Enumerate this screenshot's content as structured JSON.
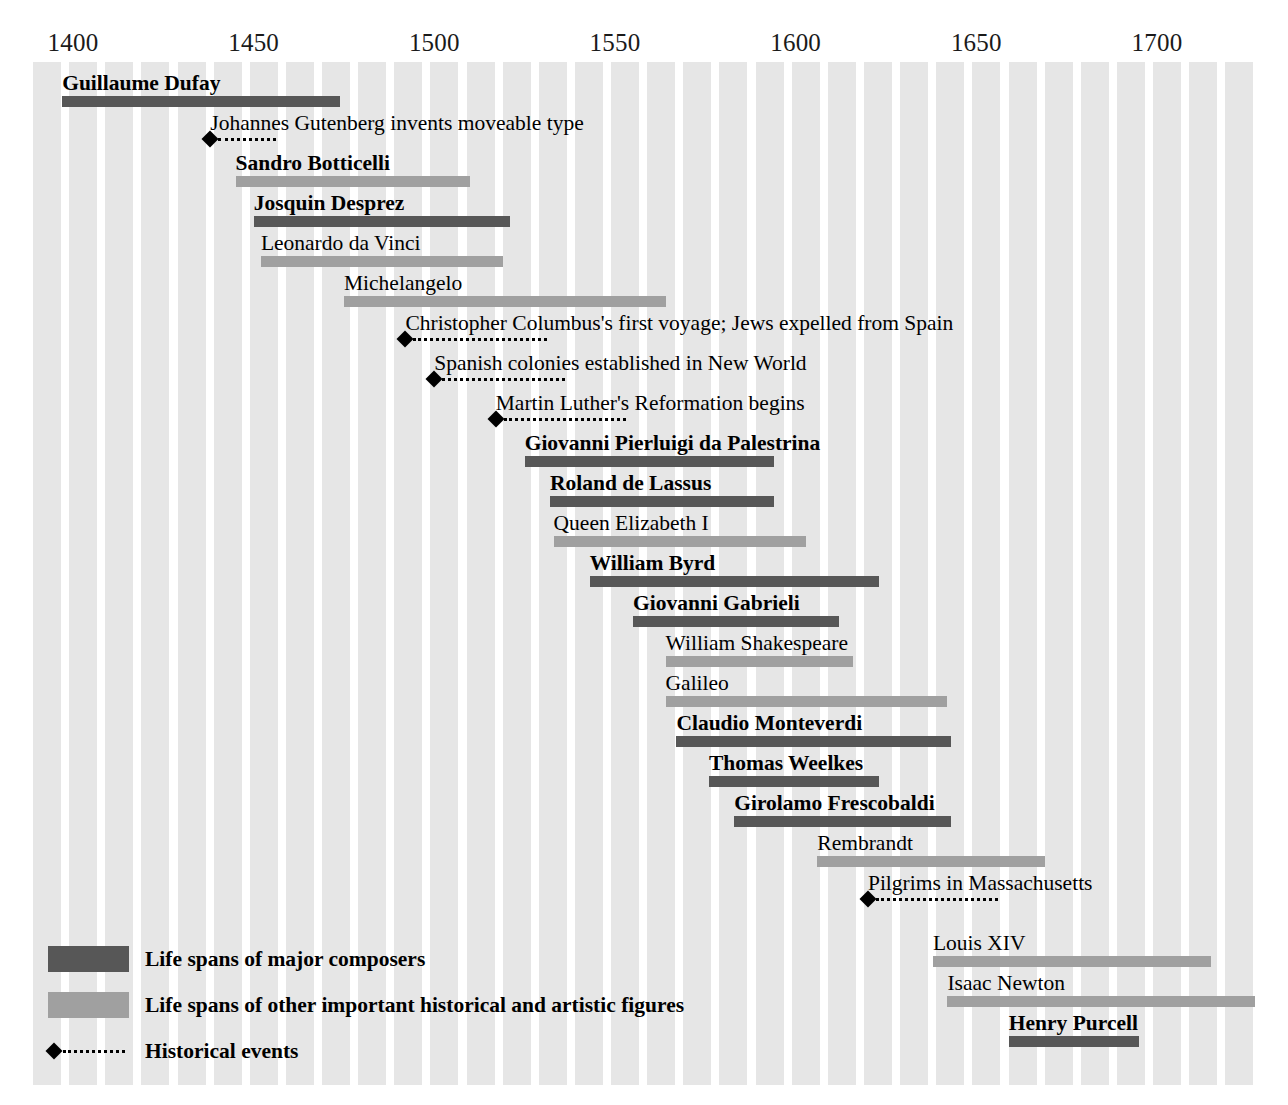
{
  "chart_data": {
    "type": "bar",
    "title": "",
    "subtitle": "",
    "xlabel": "",
    "ylabel": "",
    "xlim": [
      1390,
      1718
    ],
    "axis_ticks": [
      1400,
      1450,
      1500,
      1550,
      1600,
      1650,
      1700
    ],
    "tick_labels": [
      "1400",
      "1450",
      "1500",
      "1550",
      "1600",
      "1650",
      "1700"
    ],
    "grid": "vertical-striped-bands",
    "legend_position": "bottom-left",
    "orientation": "horizontal-timeline",
    "categories": [
      "Guillaume Dufay",
      "Johannes Gutenberg invents moveable type",
      "Sandro Botticelli",
      "Josquin Desprez",
      "Leonardo da Vinci",
      "Michelangelo",
      "Christopher Columbus's first voyage; Jews expelled from Spain",
      "Spanish colonies established in New World",
      "Martin Luther's Reformation begins",
      "Giovanni Pierluigi da Palestrina",
      "Roland de Lassus",
      "Queen Elizabeth I",
      "William Byrd",
      "Giovanni Gabrieli",
      "William Shakespeare",
      "Galileo",
      "Claudio Monteverdi",
      "Thomas Weelkes",
      "Girolamo Frescobaldi",
      "Rembrandt",
      "Pilgrims in Massachusetts",
      "Louis XIV",
      "Isaac Newton",
      "Henry Purcell"
    ],
    "series": [
      {
        "name": "Life spans of major composers",
        "color": "#575757",
        "items": [
          {
            "label": "Guillaume Dufay",
            "start": 1397,
            "end": 1474
          },
          {
            "label": "Josquin Desprez",
            "start": 1450,
            "end": 1521
          },
          {
            "label": "Giovanni Pierluigi da Palestrina",
            "start": 1525,
            "end": 1594
          },
          {
            "label": "Roland de Lassus",
            "start": 1532,
            "end": 1594
          },
          {
            "label": "William Byrd",
            "start": 1543,
            "end": 1623
          },
          {
            "label": "Giovanni Gabrieli",
            "start": 1555,
            "end": 1612
          },
          {
            "label": "Claudio Monteverdi",
            "start": 1567,
            "end": 1643
          },
          {
            "label": "Thomas Weelkes",
            "start": 1576,
            "end": 1623
          },
          {
            "label": "Girolamo Frescobaldi",
            "start": 1583,
            "end": 1643
          },
          {
            "label": "Henry Purcell",
            "start": 1659,
            "end": 1695
          }
        ]
      },
      {
        "name": "Life spans of other important historical and artistic figures",
        "color": "#a0a0a0",
        "items": [
          {
            "label": "Sandro Botticelli",
            "start": 1445,
            "end": 1510
          },
          {
            "label": "Leonardo da Vinci",
            "start": 1452,
            "end": 1519
          },
          {
            "label": "Michelangelo",
            "start": 1475,
            "end": 1564
          },
          {
            "label": "Queen Elizabeth I",
            "start": 1533,
            "end": 1603
          },
          {
            "label": "William Shakespeare",
            "start": 1564,
            "end": 1616
          },
          {
            "label": "Galileo",
            "start": 1564,
            "end": 1642
          },
          {
            "label": "Rembrandt",
            "start": 1606,
            "end": 1669
          },
          {
            "label": "Louis XIV",
            "start": 1638,
            "end": 1715
          },
          {
            "label": "Isaac Newton",
            "start": 1642,
            "end": 1727
          }
        ]
      },
      {
        "name": "Historical events",
        "color": "#000000",
        "items": [
          {
            "label": "Johannes Gutenberg invents moveable type",
            "start": 1438,
            "end": 1455
          },
          {
            "label": "Christopher Columbus's first voyage; Jews expelled from Spain",
            "start": 1492,
            "end": 1530
          },
          {
            "label": "Spanish colonies established in New World",
            "start": 1500,
            "end": 1535
          },
          {
            "label": "Martin Luther's Reformation begins",
            "start": 1517,
            "end": 1552
          },
          {
            "label": "Pilgrims in Massachusetts",
            "start": 1620,
            "end": 1655
          }
        ]
      }
    ]
  },
  "axis": {
    "ticks": [
      {
        "year": 1400,
        "label": "1400"
      },
      {
        "year": 1450,
        "label": "1450"
      },
      {
        "year": 1500,
        "label": "1500"
      },
      {
        "year": 1550,
        "label": "1550"
      },
      {
        "year": 1600,
        "label": "1600"
      },
      {
        "year": 1650,
        "label": "1650"
      },
      {
        "year": 1700,
        "label": "1700"
      }
    ]
  },
  "rows": [
    {
      "label": "Guillaume Dufay",
      "type": "composer",
      "bold": true,
      "start": 1397,
      "end": 1474,
      "top": 68
    },
    {
      "label": "Johannes Gutenberg invents moveable type",
      "type": "event",
      "bold": false,
      "start": 1438,
      "end": 1455,
      "top": 108
    },
    {
      "label": "Sandro Botticelli",
      "type": "figure",
      "bold": true,
      "start": 1445,
      "end": 1510,
      "top": 148
    },
    {
      "label": "Josquin Desprez",
      "type": "composer",
      "bold": true,
      "start": 1450,
      "end": 1521,
      "top": 188
    },
    {
      "label": "Leonardo da Vinci",
      "type": "figure",
      "bold": false,
      "start": 1452,
      "end": 1519,
      "top": 228
    },
    {
      "label": "Michelangelo",
      "type": "figure",
      "bold": false,
      "start": 1475,
      "end": 1564,
      "top": 268
    },
    {
      "label": "Christopher Columbus's first voyage; Jews expelled from Spain",
      "type": "event",
      "bold": false,
      "start": 1492,
      "end": 1530,
      "top": 308
    },
    {
      "label": "Spanish colonies established in New World",
      "type": "event",
      "bold": false,
      "start": 1500,
      "end": 1535,
      "top": 348
    },
    {
      "label": "Martin Luther's Reformation begins",
      "type": "event",
      "bold": false,
      "start": 1517,
      "end": 1552,
      "top": 388
    },
    {
      "label": "Giovanni Pierluigi da Palestrina",
      "type": "composer",
      "bold": true,
      "start": 1525,
      "end": 1594,
      "top": 428
    },
    {
      "label": "Roland de Lassus",
      "type": "composer",
      "bold": true,
      "start": 1532,
      "end": 1594,
      "top": 468
    },
    {
      "label": "Queen Elizabeth I",
      "type": "figure",
      "bold": false,
      "start": 1533,
      "end": 1603,
      "top": 508
    },
    {
      "label": "William Byrd",
      "type": "composer",
      "bold": true,
      "start": 1543,
      "end": 1623,
      "top": 548
    },
    {
      "label": "Giovanni Gabrieli",
      "type": "composer",
      "bold": true,
      "start": 1555,
      "end": 1612,
      "top": 588
    },
    {
      "label": "William Shakespeare",
      "type": "figure",
      "bold": false,
      "start": 1564,
      "end": 1616,
      "top": 628
    },
    {
      "label": "Galileo",
      "type": "figure",
      "bold": false,
      "start": 1564,
      "end": 1642,
      "top": 668
    },
    {
      "label": "Claudio Monteverdi",
      "type": "composer",
      "bold": true,
      "start": 1567,
      "end": 1643,
      "top": 708
    },
    {
      "label": "Thomas Weelkes",
      "type": "composer",
      "bold": true,
      "start": 1576,
      "end": 1623,
      "top": 748
    },
    {
      "label": "Girolamo Frescobaldi",
      "type": "composer",
      "bold": true,
      "start": 1583,
      "end": 1643,
      "top": 788
    },
    {
      "label": "Rembrandt",
      "type": "figure",
      "bold": false,
      "start": 1606,
      "end": 1669,
      "top": 828
    },
    {
      "label": "Pilgrims in Massachusetts",
      "type": "event",
      "bold": false,
      "start": 1620,
      "end": 1655,
      "top": 868
    },
    {
      "label": "Louis XIV",
      "type": "figure",
      "bold": false,
      "start": 1638,
      "end": 1715,
      "top": 928
    },
    {
      "label": "Isaac Newton",
      "type": "figure",
      "bold": false,
      "start": 1642,
      "end": 1727,
      "top": 968
    },
    {
      "label": "Henry Purcell",
      "type": "composer",
      "bold": true,
      "start": 1659,
      "end": 1695,
      "top": 1008
    }
  ],
  "legend": [
    {
      "kind": "composer",
      "label": "Life spans of major composers"
    },
    {
      "kind": "figure",
      "label": "Life spans of other important historical and artistic figures"
    },
    {
      "kind": "event",
      "label": "Historical events"
    }
  ],
  "colors": {
    "composer_bar": "#575757",
    "figure_bar": "#a0a0a0",
    "event_marker": "#000000",
    "stripe_band": "#e6e6e6",
    "page_background": "#ffffff"
  }
}
